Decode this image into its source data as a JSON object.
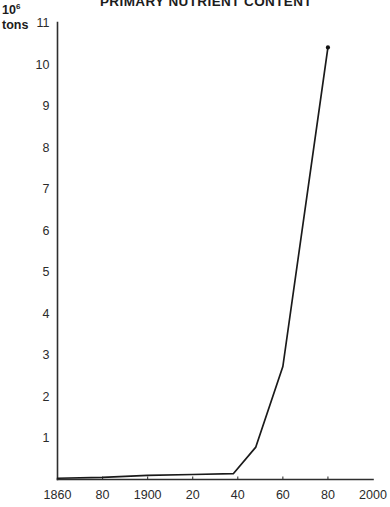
{
  "chart_data": {
    "type": "line",
    "title": "PRIMARY NUTRIENT CONTENT",
    "xlabel": "",
    "ylabel": "10⁶ tons",
    "ylabel_prefix": "10",
    "ylabel_exponent": "6",
    "ylabel_suffix": "tons",
    "grid": false,
    "legend": "none",
    "xlim": [
      1860,
      2000
    ],
    "ylim": [
      0,
      11
    ],
    "xticks": [
      1860,
      1880,
      1900,
      1920,
      1940,
      1960,
      1980,
      2000
    ],
    "xtick_labels": [
      "1860",
      "80",
      "1900",
      "20",
      "40",
      "60",
      "80",
      "2000"
    ],
    "yticks": [
      1,
      2,
      3,
      4,
      5,
      6,
      7,
      8,
      9,
      10,
      11
    ],
    "ytick_labels": [
      "1",
      "2",
      "3",
      "4",
      "5",
      "6",
      "7",
      "8",
      "9",
      "10",
      "11"
    ],
    "series": [
      {
        "name": "Primary nutrient content",
        "color": "#1a1a1a",
        "x": [
          1860,
          1880,
          1900,
          1920,
          1938,
          1948,
          1960,
          1980
        ],
        "values": [
          0.03,
          0.05,
          0.1,
          0.12,
          0.14,
          0.78,
          2.72,
          10.4
        ]
      }
    ],
    "annotations": []
  },
  "axes": {
    "axis_color": "#2e2e2e",
    "line_color": "#1a1a1a"
  }
}
